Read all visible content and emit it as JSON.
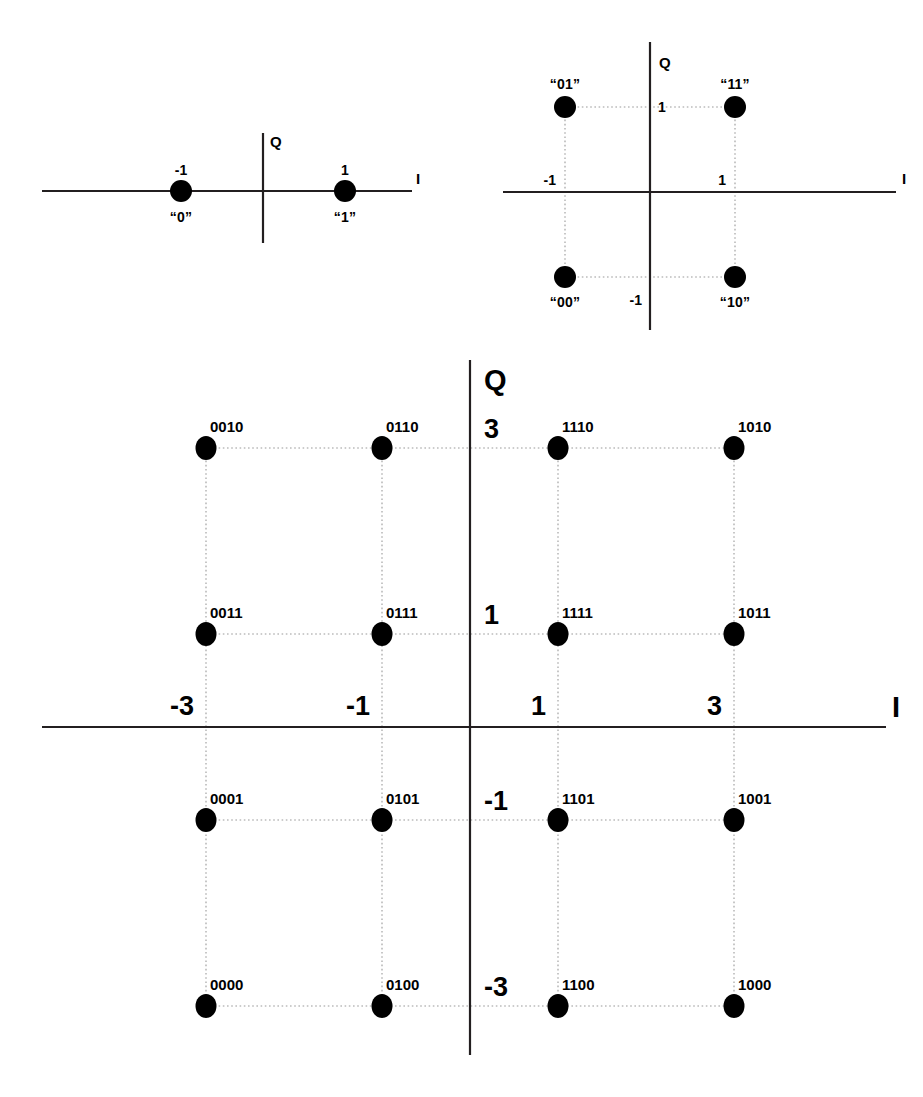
{
  "figure": {
    "caption": ""
  },
  "chart_data": [
    {
      "type": "scatter",
      "name": "bpsk",
      "title": "BPSK constellation",
      "xlabel": "I",
      "ylabel": "Q",
      "xlim": [
        -2.2,
        2.2
      ],
      "ylim": [
        -1.6,
        1.6
      ],
      "grid": false,
      "xticks": [
        -1,
        1
      ],
      "xtick_labels": [
        "-1",
        "1"
      ],
      "yticks": [],
      "ytick_labels": [],
      "points": [
        {
          "label": "“0”",
          "x": -1,
          "y": 0,
          "tick": "-1",
          "label_pos": "below",
          "tick_pos": "above"
        },
        {
          "label": "“1”",
          "x": 1,
          "y": 0,
          "tick": "1",
          "label_pos": "below",
          "tick_pos": "above"
        }
      ]
    },
    {
      "type": "scatter",
      "name": "qpsk",
      "title": "QPSK constellation",
      "xlabel": "I",
      "ylabel": "Q",
      "xlim": [
        -2.1,
        2.1
      ],
      "ylim": [
        -2.1,
        2.1
      ],
      "grid": true,
      "xticks": [
        -1,
        1
      ],
      "xtick_labels": [
        "-1",
        "1"
      ],
      "yticks": [
        -1,
        1
      ],
      "ytick_labels": [
        "-1",
        "1"
      ],
      "points": [
        {
          "label": "“01”",
          "x": -1,
          "y": 1,
          "label_pos": "above"
        },
        {
          "label": "“11”",
          "x": 1,
          "y": 1,
          "label_pos": "above"
        },
        {
          "label": "“00”",
          "x": -1,
          "y": -1,
          "label_pos": "below"
        },
        {
          "label": "“10”",
          "x": 1,
          "y": -1,
          "label_pos": "below"
        }
      ]
    },
    {
      "type": "scatter",
      "name": "qam16",
      "title": "16-QAM constellation",
      "xlabel": "I",
      "ylabel": "Q",
      "xlim": [
        -4.6,
        4.6
      ],
      "ylim": [
        -4.4,
        4.4
      ],
      "grid": true,
      "xticks": [
        -3,
        -1,
        1,
        3
      ],
      "xtick_labels": [
        "-3",
        "-1",
        "1",
        "3"
      ],
      "yticks": [
        -3,
        -1,
        1,
        3
      ],
      "ytick_labels": [
        "-3",
        "-1",
        "1",
        "3"
      ],
      "points": [
        {
          "label": "0010",
          "x": -3,
          "y": 3
        },
        {
          "label": "0110",
          "x": -1,
          "y": 3
        },
        {
          "label": "1110",
          "x": 1,
          "y": 3
        },
        {
          "label": "1010",
          "x": 3,
          "y": 3
        },
        {
          "label": "0011",
          "x": -3,
          "y": 1
        },
        {
          "label": "0111",
          "x": -1,
          "y": 1
        },
        {
          "label": "1111",
          "x": 1,
          "y": 1
        },
        {
          "label": "1011",
          "x": 3,
          "y": 1
        },
        {
          "label": "0001",
          "x": -3,
          "y": -1
        },
        {
          "label": "0101",
          "x": -1,
          "y": -1
        },
        {
          "label": "1101",
          "x": 1,
          "y": -1
        },
        {
          "label": "1001",
          "x": 3,
          "y": -1
        },
        {
          "label": "0000",
          "x": -3,
          "y": -3
        },
        {
          "label": "0100",
          "x": -1,
          "y": -3
        },
        {
          "label": "1100",
          "x": 1,
          "y": -3
        },
        {
          "label": "1000",
          "x": 3,
          "y": -3
        }
      ]
    }
  ]
}
